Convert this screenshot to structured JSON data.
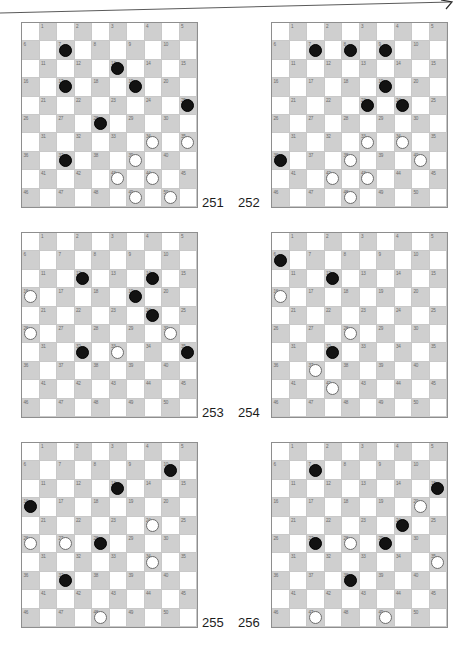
{
  "page": {
    "kind": "draughts-problem-diagrams",
    "board_size": 10,
    "playable_squares": 50,
    "light_square_color": "#ffffff",
    "dark_square_color": "#cfcfcf",
    "black_piece_color": "#121212",
    "white_piece_color": "#ffffff",
    "grid_line_color": "#c9c9c9",
    "border_color": "#8e8e8e",
    "label_color": "#6a6a6a",
    "caption_color": "#1c1c1c"
  },
  "rows": [
    {
      "caption_left": "251",
      "caption_right": "252",
      "diagrams": [
        {
          "number": "251",
          "black": [
            7,
            13,
            17,
            19,
            25,
            28,
            37
          ],
          "white": [
            34,
            35,
            39,
            43,
            44,
            49,
            50
          ]
        },
        {
          "number": "252",
          "black": [
            7,
            8,
            9,
            19,
            23,
            24,
            36
          ],
          "white": [
            33,
            34,
            38,
            40,
            42,
            43,
            48
          ]
        }
      ]
    },
    {
      "caption_left": "253",
      "caption_right": "254",
      "diagrams": [
        {
          "number": "253",
          "black": [
            12,
            14,
            19,
            24,
            32,
            35
          ],
          "white": [
            16,
            26,
            30,
            33
          ]
        },
        {
          "number": "254",
          "black": [
            6,
            12,
            32
          ],
          "white": [
            16,
            28,
            37,
            42
          ]
        }
      ]
    },
    {
      "caption_left": "255",
      "caption_right": "256",
      "diagrams": [
        {
          "number": "255",
          "black": [
            10,
            13,
            16,
            28,
            37
          ],
          "white": [
            24,
            26,
            27,
            34,
            48
          ]
        },
        {
          "number": "256",
          "black": [
            7,
            15,
            24,
            27,
            29,
            38
          ],
          "white": [
            20,
            28,
            35,
            47,
            49
          ]
        }
      ]
    }
  ]
}
